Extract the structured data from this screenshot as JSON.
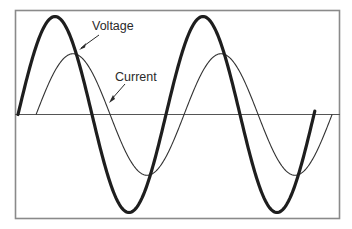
{
  "diagram": {
    "title": "",
    "labels": {
      "voltage": "Voltage",
      "current": "Current"
    },
    "colors": {
      "frame": "#8a8a8a",
      "axis": "#555555",
      "voltage": "#1e1e1e",
      "current": "#333333",
      "background": "#ffffff"
    }
  },
  "chart_data": {
    "type": "line",
    "title": "",
    "xlabel": "",
    "ylabel": "",
    "grid": false,
    "legend": "inline annotations with arrows",
    "x_unit": "phase (degrees)",
    "xlim": [
      0,
      730
    ],
    "ylim": [
      -1.1,
      1.1
    ],
    "series": [
      {
        "name": "Voltage",
        "amplitude": 1.0,
        "phase_shift_deg": 0,
        "x_range_deg": [
          0,
          720
        ],
        "line_width": "thick",
        "points": [
          [
            0,
            0
          ],
          [
            90,
            1.0
          ],
          [
            180,
            0
          ],
          [
            270,
            -1.0
          ],
          [
            360,
            0
          ],
          [
            450,
            1.0
          ],
          [
            540,
            0
          ],
          [
            630,
            -1.0
          ],
          [
            720,
            0
          ]
        ]
      },
      {
        "name": "Current",
        "amplitude": 0.62,
        "phase_shift_deg": 44,
        "x_range_deg": [
          44,
          780
        ],
        "line_width": "thin",
        "points": [
          [
            44,
            0
          ],
          [
            134,
            0.62
          ],
          [
            224,
            0
          ],
          [
            314,
            -0.62
          ],
          [
            404,
            0
          ],
          [
            494,
            0.62
          ],
          [
            584,
            0
          ],
          [
            674,
            -0.62
          ],
          [
            740,
            -0.25
          ]
        ]
      }
    ],
    "annotations": [
      {
        "text": "Voltage",
        "arrow_to_series": "Voltage"
      },
      {
        "text": "Current",
        "arrow_to_series": "Current"
      }
    ]
  }
}
